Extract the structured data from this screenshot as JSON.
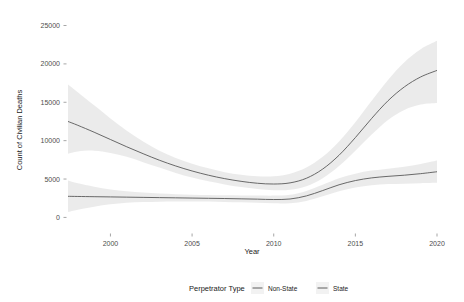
{
  "chart_data": {
    "type": "line",
    "title": "",
    "xlabel": "Year",
    "ylabel": "Count of Civilian Deaths",
    "xlim": [
      1997.4,
      2020.0
    ],
    "ylim": [
      -1900,
      26500
    ],
    "xticks": [
      2000,
      2005,
      2010,
      2015,
      2020
    ],
    "yticks": [
      0,
      5000,
      10000,
      15000,
      20000,
      25000
    ],
    "xtick_labels": [
      "2000",
      "2005",
      "2010",
      "2015",
      "2020"
    ],
    "ytick_labels": [
      "0",
      "5000",
      "10000",
      "15000",
      "20000",
      "25000"
    ],
    "grid": false,
    "legend": {
      "title": "Perpetrator Type",
      "position": "bottom",
      "entries": [
        {
          "label": "Non-State",
          "color": "#4d4d4d"
        },
        {
          "label": "State",
          "color": "#4d4d4d"
        }
      ]
    },
    "band_fill": "#e8e8e8",
    "line_color": "#595959",
    "series": [
      {
        "name": "Non-State",
        "x": [
          1997.4,
          1998,
          1999,
          2000,
          2001,
          2002,
          2003,
          2004,
          2005,
          2006,
          2007,
          2008,
          2009,
          2010,
          2011,
          2012,
          2013,
          2014,
          2015,
          2016,
          2017,
          2018,
          2019,
          2020
        ],
        "fit": [
          12500,
          12000,
          11100,
          10150,
          9200,
          8300,
          7450,
          6700,
          6050,
          5500,
          5050,
          4700,
          4450,
          4350,
          4500,
          5100,
          6300,
          8100,
          10400,
          12900,
          15200,
          17000,
          18300,
          19150
        ],
        "ci_low": [
          8300,
          8600,
          8700,
          8400,
          7900,
          7200,
          6500,
          5800,
          5200,
          4700,
          4300,
          3950,
          3700,
          3550,
          3600,
          4050,
          5100,
          6700,
          8700,
          10800,
          12700,
          14000,
          14700,
          14900
        ],
        "ci_high": [
          17300,
          16300,
          14600,
          12900,
          11300,
          9900,
          8700,
          7750,
          7000,
          6400,
          5900,
          5550,
          5350,
          5350,
          5700,
          6500,
          7900,
          9900,
          12400,
          15200,
          17900,
          20200,
          21900,
          23000
        ]
      },
      {
        "name": "State",
        "x": [
          1997.4,
          1998,
          1999,
          2000,
          2001,
          2002,
          2003,
          2004,
          2005,
          2006,
          2007,
          2008,
          2009,
          2010,
          2011,
          2012,
          2013,
          2014,
          2015,
          2016,
          2017,
          2018,
          2019,
          2020
        ],
        "fit": [
          2750,
          2730,
          2700,
          2670,
          2640,
          2610,
          2580,
          2550,
          2520,
          2490,
          2460,
          2420,
          2380,
          2330,
          2400,
          2800,
          3500,
          4250,
          4800,
          5150,
          5350,
          5500,
          5700,
          5950
        ],
        "ci_low": [
          700,
          1000,
          1400,
          1700,
          1900,
          2000,
          2050,
          2080,
          2080,
          2060,
          2020,
          1970,
          1900,
          1830,
          1860,
          2150,
          2750,
          3400,
          3900,
          4200,
          4350,
          4400,
          4450,
          4500
        ],
        "ci_high": [
          4800,
          4450,
          4000,
          3650,
          3400,
          3230,
          3120,
          3030,
          2960,
          2920,
          2890,
          2870,
          2860,
          2840,
          2950,
          3450,
          4250,
          5100,
          5700,
          6100,
          6350,
          6600,
          6950,
          7400
        ]
      }
    ]
  }
}
